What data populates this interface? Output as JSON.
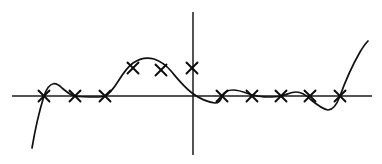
{
  "figure": {
    "title": "",
    "background_color": "#ffffff",
    "width": 382,
    "height": 164
  },
  "axes": {
    "x_axis": {
      "name": "horizontal-axis",
      "y_pixel": 96,
      "x_start_pixel": 12,
      "x_end_pixel": 372,
      "color": "#1a1a1a",
      "ticks": [],
      "label": ""
    },
    "y_axis": {
      "name": "vertical-axis",
      "x_pixel": 193,
      "y_start_pixel": 12,
      "y_end_pixel": 155,
      "color": "#1a1a1a",
      "ticks": [],
      "label": ""
    },
    "origin": {
      "x": 193,
      "y": 96
    }
  },
  "chart_data": {
    "type": "scatter",
    "title": "",
    "xlabel": "",
    "ylabel": "",
    "grid": false,
    "legend": null,
    "marker_style": "x-cross",
    "marker_color": "#0d0d0d",
    "curve_color": "#111111",
    "axis_units": "pixels",
    "xlim": [
      12,
      372
    ],
    "ylim": [
      12,
      155
    ],
    "points_pixel": [
      {
        "x": 44,
        "y": 96
      },
      {
        "x": 75,
        "y": 96
      },
      {
        "x": 105,
        "y": 96
      },
      {
        "x": 133,
        "y": 68
      },
      {
        "x": 161,
        "y": 70
      },
      {
        "x": 192,
        "y": 68
      },
      {
        "x": 222,
        "y": 96
      },
      {
        "x": 252,
        "y": 96
      },
      {
        "x": 281,
        "y": 96
      },
      {
        "x": 310,
        "y": 96
      },
      {
        "x": 340,
        "y": 96
      }
    ],
    "x": [
      -149,
      -118,
      -88,
      -60,
      -32,
      -1,
      29,
      59,
      88,
      117,
      147
    ],
    "y": [
      0,
      0,
      0,
      28,
      26,
      28,
      0,
      0,
      0,
      0,
      0
    ],
    "series": [
      {
        "name": "data-points",
        "values": [
          0,
          0,
          0,
          28,
          26,
          28,
          0,
          0,
          0,
          0,
          0
        ]
      }
    ],
    "curve": {
      "name": "interpolating-curve",
      "path": "M 32,148 C 35,130 39,112 44,96 C 50,79 57,83 62,88 C 67,92 70,95 75,96 C 82,97 88,97 95,97 C 99,97 102,97 105,96 C 110,94 114,88 119,80 C 124,72 129,66 133,63 C 140,58 147,57 154,59 C 160,61 166,65 171,71 C 177,78 183,86 192,93 C 200,99 208,102 215,103 C 219,103 221,100 222,96 C 224,92 228,90 233,90 C 240,90 246,93 252,95 C 257,96 262,97 267,97 C 272,97 277,97 281,96 C 286,95 291,92 296,92 C 301,92 306,95 310,99 C 316,104 322,109 328,110 C 333,110 337,104 340,96 C 345,82 352,66 360,52 C 363,47 365,44 368,41"
    },
    "marker_size_px": 11
  },
  "elements": {
    "marker_name": "data-point-marker",
    "curve_name": "fitted-curve"
  }
}
